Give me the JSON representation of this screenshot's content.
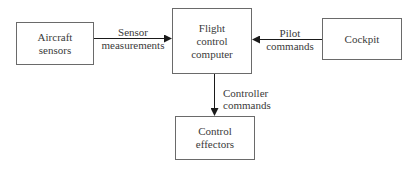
{
  "diagram": {
    "nodes": [
      {
        "id": "aircraft_sensors",
        "lines": [
          "Aircraft",
          "sensors"
        ]
      },
      {
        "id": "flight_control_computer",
        "lines": [
          "Flight",
          "control",
          "computer"
        ]
      },
      {
        "id": "cockpit",
        "lines": [
          "Cockpit"
        ]
      },
      {
        "id": "control_effectors",
        "lines": [
          "Control",
          "effectors"
        ]
      }
    ],
    "edges": [
      {
        "from": "aircraft_sensors",
        "to": "flight_control_computer",
        "lines": [
          "Sensor",
          "measurements"
        ]
      },
      {
        "from": "cockpit",
        "to": "flight_control_computer",
        "lines": [
          "Pilot",
          "commands"
        ]
      },
      {
        "from": "flight_control_computer",
        "to": "control_effectors",
        "lines": [
          "Controller",
          "commands"
        ]
      }
    ]
  },
  "colors": {
    "stroke": "#6a6a6a",
    "arrow": "#1a1a1a",
    "text": "#3a3a3a"
  }
}
